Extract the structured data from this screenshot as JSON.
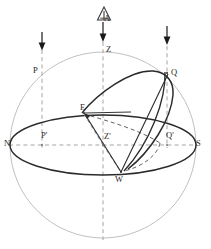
{
  "figure": {
    "name": "celestial-sphere-diagram",
    "type": "geometric-sphere-diagram",
    "background_color": "#ffffff",
    "colors": {
      "sphere_outline": "#b9b9b9",
      "horizon_ellipse": "#2b2b2b",
      "great_circle": "#2b2b2b",
      "dashed_guide": "#9a9a9a",
      "dashed_hidden_arc": "#5a5a5a",
      "arrow": "#1a1a1a",
      "label_text": "#2a2a2a"
    },
    "geometry": {
      "sphere_center_x": 103,
      "sphere_center_y": 145,
      "sphere_radius": 93,
      "horizon_rx": 93,
      "horizon_ry": 30
    }
  },
  "labels": [
    {
      "id": "A",
      "text": "A",
      "x": 104,
      "y": 14,
      "role": "apex-marker-label"
    },
    {
      "id": "Z",
      "text": "Z",
      "x": 106,
      "y": 48,
      "role": "zenith"
    },
    {
      "id": "P",
      "text": "P",
      "x": 36,
      "y": 70,
      "role": "pole-upper"
    },
    {
      "id": "Q",
      "text": "Q",
      "x": 170,
      "y": 72,
      "role": "point-q-upper"
    },
    {
      "id": "E",
      "text": "E",
      "x": 83,
      "y": 107,
      "role": "point-east"
    },
    {
      "id": "N",
      "text": "N",
      "x": 5,
      "y": 142,
      "role": "north-point"
    },
    {
      "id": "Pp",
      "text": "P'",
      "x": 42,
      "y": 134,
      "role": "pole-projection"
    },
    {
      "id": "Zp",
      "text": "Z'",
      "x": 105,
      "y": 136,
      "role": "sphere-center-projection"
    },
    {
      "id": "Qp",
      "text": "Q'",
      "x": 165,
      "y": 134,
      "role": "point-q-projection"
    },
    {
      "id": "S",
      "text": "S",
      "x": 197,
      "y": 142,
      "role": "south-point"
    },
    {
      "id": "W",
      "text": "W",
      "x": 115,
      "y": 178,
      "role": "point-west"
    }
  ],
  "arrows": [
    {
      "id": "arrow-left",
      "x": 42,
      "y_top": 32,
      "y_bottom": 50,
      "direction": "down"
    },
    {
      "id": "arrow-center",
      "x": 103,
      "y_top": 22,
      "y_bottom": 42,
      "direction": "down"
    },
    {
      "id": "arrow-right",
      "x": 167,
      "y_top": 26,
      "y_bottom": 46,
      "direction": "down"
    }
  ],
  "markers": {
    "apex_triangle": {
      "cx": 104,
      "cy": 14,
      "size": 9,
      "shape": "triangle-outline-with-stem"
    }
  }
}
